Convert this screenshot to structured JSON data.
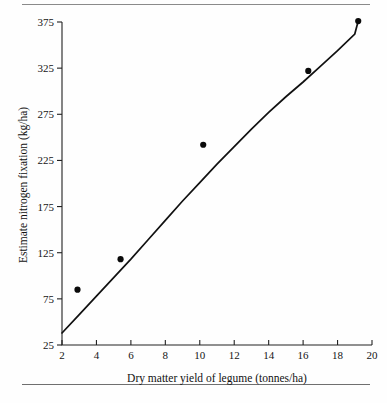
{
  "figure": {
    "axis": {
      "x_label": "Dry matter yield of legume (tonnes/ha)",
      "y_label": "Estimate nitrogen fixation (kg/ha)",
      "x_ticks": [
        "2",
        "4",
        "6",
        "8",
        "10",
        "12",
        "14",
        "16",
        "18",
        "20"
      ],
      "y_ticks": [
        "25",
        "75",
        "125",
        "175",
        "225",
        "275",
        "325",
        "375"
      ]
    },
    "colors": {
      "ink": "#111111",
      "rule": "#8a8a8a"
    }
  },
  "chart_data": {
    "type": "scatter",
    "title": "",
    "xlabel": "Dry matter yield of legume (tonnes/ha)",
    "ylabel": "Estimate nitrogen fixation (kg/ha)",
    "xlim": [
      2,
      20
    ],
    "ylim": [
      25,
      375
    ],
    "xticks": [
      2,
      4,
      6,
      8,
      10,
      12,
      14,
      16,
      18,
      20
    ],
    "yticks": [
      25,
      75,
      125,
      175,
      225,
      275,
      325,
      375
    ],
    "grid": false,
    "legend": null,
    "series": [
      {
        "name": "Observed sites",
        "marker": "filled-circle",
        "x": [
          2.9,
          5.4,
          10.2,
          16.3,
          19.2
        ],
        "y": [
          85,
          118,
          242,
          322,
          376
        ]
      },
      {
        "name": "Fitted curve",
        "type": "line",
        "x": [
          2.0,
          3.0,
          4.0,
          5.0,
          6.0,
          7.0,
          8.0,
          9.0,
          10.0,
          11.0,
          12.0,
          13.0,
          14.0,
          15.0,
          16.0,
          17.0,
          18.0,
          19.0,
          19.2
        ],
        "y": [
          38,
          58,
          78,
          98,
          118,
          139,
          160,
          181,
          201,
          221,
          240,
          259,
          277,
          294,
          310,
          327,
          344,
          362,
          376
        ]
      }
    ]
  }
}
